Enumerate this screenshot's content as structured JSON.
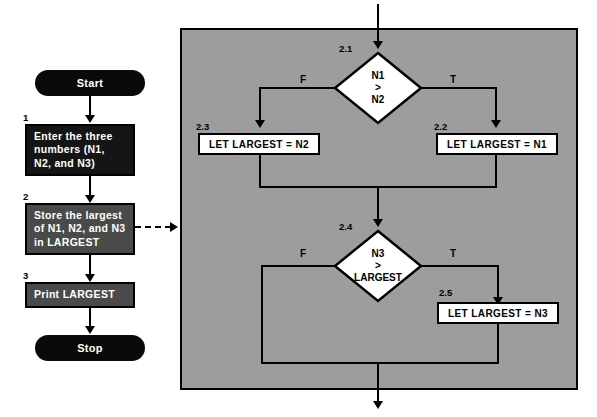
{
  "diagram": {
    "colors": {
      "panel_gray": "#9d9d9d",
      "terminator_black": "#0a0a0a",
      "process_dark": "#151515",
      "process_mid": "#4a4a4a",
      "process_white": "#ffffff",
      "stroke": "#000000",
      "text_on_dark": "#ffffff",
      "background": "#ffffff"
    }
  },
  "main_flow": {
    "start": {
      "label": "Start",
      "shape": "terminator"
    },
    "steps": [
      {
        "number": "1",
        "label": "Enter the three numbers (N1, N2, and N3)",
        "lines": [
          "Enter the three",
          "numbers (N1,",
          "N2, and N3)"
        ],
        "shape": "process"
      },
      {
        "number": "2",
        "label": "Store the largest of N1, N2, and N3 in LARGEST",
        "lines": [
          "Store the largest",
          "of N1, N2, and N3",
          "in LARGEST"
        ],
        "shape": "process"
      },
      {
        "number": "3",
        "label": "Print LARGEST",
        "lines": [
          "Print LARGEST"
        ],
        "shape": "process"
      }
    ],
    "stop": {
      "label": "Stop",
      "shape": "terminator"
    }
  },
  "expansion_panel": {
    "refines_step": "2",
    "decisions": [
      {
        "number": "2.1",
        "lines": [
          "N1",
          ">",
          "N2"
        ],
        "condition": "N1 > N2",
        "true_label": "T",
        "false_label": "F"
      },
      {
        "number": "2.4",
        "lines": [
          "N3",
          ">",
          "LARGEST"
        ],
        "condition": "N3 > LARGEST",
        "true_label": "T",
        "false_label": "F"
      }
    ],
    "actions": [
      {
        "number": "2.2",
        "label": "LET LARGEST  =  N1",
        "branch": "true-of-2.1"
      },
      {
        "number": "2.3",
        "label": "LET LARGEST  =  N2",
        "branch": "false-of-2.1"
      },
      {
        "number": "2.5",
        "label": "LET LARGEST  =  N3",
        "branch": "true-of-2.4"
      }
    ]
  }
}
